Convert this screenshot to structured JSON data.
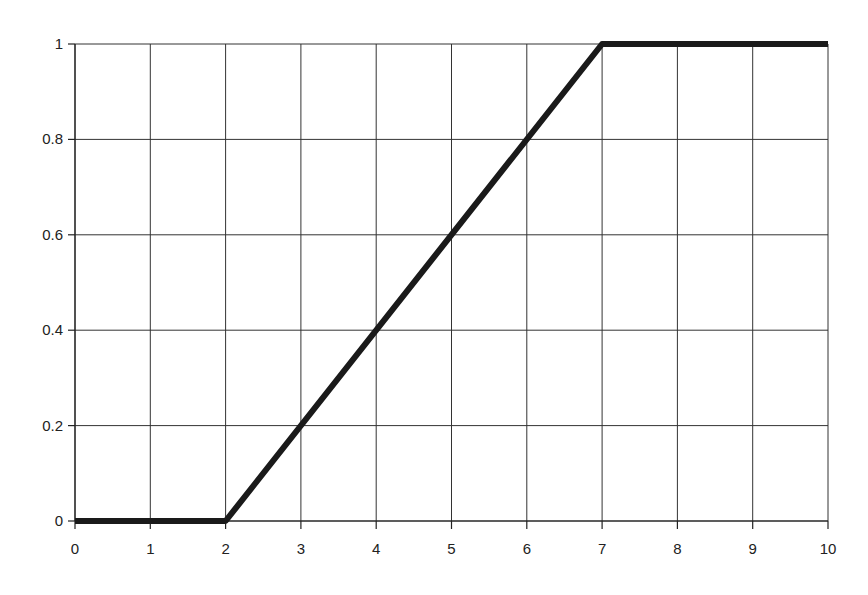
{
  "chart_data": {
    "type": "line",
    "title": "",
    "xlabel": "",
    "ylabel": "",
    "xlim": [
      0,
      10
    ],
    "ylim": [
      0,
      1
    ],
    "grid": true,
    "legend": null,
    "x_ticks": [
      "0",
      "1",
      "2",
      "3",
      "4",
      "5",
      "6",
      "7",
      "8",
      "9",
      "10"
    ],
    "y_ticks": [
      "0",
      "0.2",
      "0.4",
      "0.6",
      "0.8",
      "1"
    ],
    "series": [
      {
        "name": "membership",
        "x": [
          0,
          2,
          7,
          10
        ],
        "y": [
          0,
          0,
          1,
          1
        ],
        "color": "#1a1a1a"
      }
    ]
  }
}
